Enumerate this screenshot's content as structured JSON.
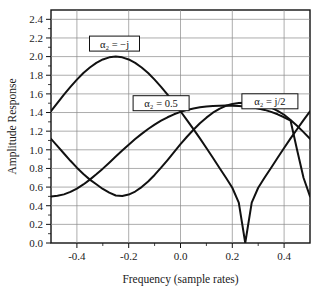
{
  "chart_data": {
    "type": "line",
    "title": "",
    "xlabel": "Frequency (sample rates)",
    "ylabel": "Amplitude Response",
    "xlim": [
      -0.5,
      0.5
    ],
    "ylim": [
      0.0,
      2.5
    ],
    "grid": true,
    "legend_position": "inline-annotations",
    "xticks": [
      -0.4,
      -0.2,
      0.0,
      0.2,
      0.4
    ],
    "xtick_labels": [
      "-0.4",
      "-0.2",
      "0.0",
      "0.2",
      "0.4"
    ],
    "yticks": [
      0.0,
      0.2,
      0.4,
      0.6,
      0.8,
      1.0,
      1.2,
      1.4,
      1.6,
      1.8,
      2.0,
      2.2,
      2.4
    ],
    "ytick_labels": [
      "0.0",
      "0.2",
      "0.4",
      "0.6",
      "0.8",
      "1.0",
      "1.2",
      "1.4",
      "1.6",
      "1.8",
      "2.0",
      "2.2",
      "2.4"
    ],
    "x": [
      -0.5,
      -0.475,
      -0.45,
      -0.425,
      -0.4,
      -0.375,
      -0.35,
      -0.325,
      -0.3,
      -0.275,
      -0.25,
      -0.225,
      -0.2,
      -0.175,
      -0.15,
      -0.125,
      -0.1,
      -0.075,
      -0.05,
      -0.025,
      0.0,
      0.025,
      0.05,
      0.075,
      0.1,
      0.125,
      0.15,
      0.175,
      0.2,
      0.225,
      0.25,
      0.275,
      0.3,
      0.325,
      0.35,
      0.375,
      0.4,
      0.425,
      0.45,
      0.475,
      0.5
    ],
    "series": [
      {
        "name": "alpha2 = -j",
        "label": "α₂ = −j",
        "label_sub": "2",
        "values": [
          1.414,
          1.504,
          1.592,
          1.675,
          1.753,
          1.824,
          1.883,
          1.932,
          1.969,
          1.992,
          2.0,
          1.992,
          1.969,
          1.932,
          1.883,
          1.824,
          1.753,
          1.675,
          1.592,
          1.504,
          1.414,
          1.319,
          1.221,
          1.122,
          1.02,
          0.914,
          0.808,
          0.702,
          0.593,
          0.433,
          0.0,
          0.433,
          0.593,
          0.702,
          0.808,
          0.914,
          1.02,
          1.122,
          1.221,
          1.319,
          1.414
        ]
      },
      {
        "name": "alpha2 = 0.5",
        "label": "α₂ = 0.5",
        "label_sub": "2",
        "values": [
          0.5,
          0.506,
          0.522,
          0.548,
          0.584,
          0.628,
          0.68,
          0.737,
          0.798,
          0.862,
          0.927,
          0.992,
          1.055,
          1.115,
          1.171,
          1.223,
          1.27,
          1.312,
          1.349,
          1.381,
          1.407,
          1.428,
          1.444,
          1.456,
          1.465,
          1.47,
          1.473,
          1.474,
          1.473,
          1.47,
          1.465,
          1.456,
          1.444,
          1.428,
          1.407,
          1.381,
          1.349,
          1.312,
          1.0,
          0.7,
          0.5
        ]
      },
      {
        "name": "alpha2 = j/2",
        "label": "α₂ = j/2",
        "label_sub": "2",
        "values": [
          1.118,
          1.04,
          0.96,
          0.882,
          0.808,
          0.74,
          0.68,
          0.63,
          0.58,
          0.54,
          0.51,
          0.505,
          0.52,
          0.552,
          0.6,
          0.66,
          0.73,
          0.808,
          0.89,
          0.975,
          1.06,
          1.14,
          1.215,
          1.285,
          1.345,
          1.398,
          1.44,
          1.472,
          1.492,
          1.502,
          1.505,
          1.503,
          1.495,
          1.478,
          1.452,
          1.418,
          1.376,
          1.32,
          1.258,
          1.19,
          1.118
        ]
      }
    ],
    "annotations": [
      {
        "text": "α₂ = −j",
        "x_data": -0.255,
        "y_data": 2.14,
        "series": "alpha2 = -j"
      },
      {
        "text": "α₂ = 0.5",
        "x_data": -0.075,
        "y_data": 1.5,
        "series": "alpha2 = 0.5"
      },
      {
        "text": "α₂ = j/2",
        "x_data": 0.345,
        "y_data": 1.52,
        "series": "alpha2 = j/2"
      }
    ]
  },
  "colors": {
    "curve": "#111111",
    "grid": "#8a8a8a",
    "frame": "#111111",
    "background": "#ffffff",
    "text": "#1a1a1a"
  }
}
